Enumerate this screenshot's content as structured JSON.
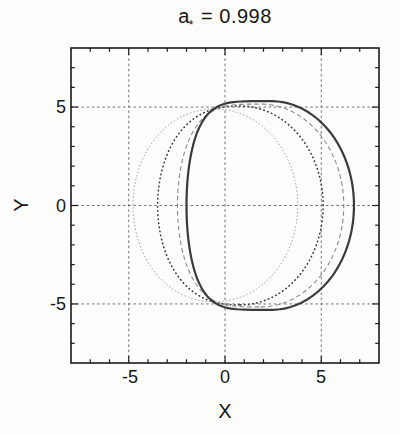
{
  "figure": {
    "title": {
      "base": "a",
      "sub": "*",
      "rest": " = 0.998"
    },
    "x_axis": {
      "label": "X",
      "ticks": [
        "-5",
        "0",
        "5"
      ]
    },
    "y_axis": {
      "label": "Y",
      "ticks": [
        "5",
        "0",
        "-5"
      ]
    }
  },
  "colors": {
    "background": "#fdfdfc",
    "frame": "#1a1a1a",
    "grid": "#757575",
    "text": "#161616"
  },
  "chart_data": {
    "type": "line",
    "title": "a* = 0.998",
    "xlabel": "X",
    "ylabel": "Y",
    "xlim": [
      -8,
      8
    ],
    "ylim": [
      -8,
      8
    ],
    "x_gridlines": [
      -5,
      0,
      5
    ],
    "y_gridlines": [
      -5,
      0,
      5
    ],
    "major_ticks": [
      -5,
      0,
      5
    ],
    "minor_tick_step": 1,
    "grid": true,
    "grid_dash": "2.6 2.6",
    "legend": "none",
    "series": [
      {
        "name": "shadow-outline-dotted-fine",
        "line_style": "dotted-fine",
        "color": "#9a9a9a",
        "stroke_width": 0.9,
        "dash": "0.8 2.8",
        "outline": {
          "cx": -0.5,
          "ar": 4.28,
          "al": 4.28,
          "b": 4.9,
          "kR": 1.0,
          "kL": 0.95
        },
        "x_extent_at_y0": [
          -4.78,
          3.78
        ],
        "y_extent": [
          -4.9,
          4.9
        ]
      },
      {
        "name": "shadow-outline-dotted-bold",
        "line_style": "dotted",
        "color": "#3a3a3a",
        "stroke_width": 1.6,
        "dash": "0.5 3.6",
        "outline": {
          "cx": 0.8,
          "ar": 4.3,
          "al": 4.3,
          "b": 5.05,
          "kR": 1.0,
          "kL": 0.8
        },
        "x_extent_at_y0": [
          -3.5,
          5.1
        ],
        "y_extent": [
          -5.05,
          5.05
        ]
      },
      {
        "name": "shadow-outline-dashed",
        "line_style": "dashed",
        "color": "#8a8a8a",
        "stroke_width": 1.1,
        "dash": "4.5 3",
        "outline": {
          "cx": 1.85,
          "ar": 4.32,
          "al": 4.32,
          "b": 5.15,
          "kR": 1.0,
          "kL": 0.55
        },
        "x_extent_at_y0": [
          -2.47,
          6.17
        ],
        "y_extent": [
          -5.15,
          5.15
        ]
      },
      {
        "name": "shadow-outline-solid",
        "line_style": "solid",
        "color": "#3b3b3b",
        "stroke_width": 2.2,
        "dash": "",
        "outline": {
          "cx": 2.4,
          "ar": 4.3,
          "al": 4.4,
          "b": 5.3,
          "kR": 1.0,
          "kL": 0.4
        },
        "x_extent_at_y0": [
          -2.0,
          6.7
        ],
        "y_extent": [
          -5.3,
          5.3
        ]
      }
    ]
  }
}
